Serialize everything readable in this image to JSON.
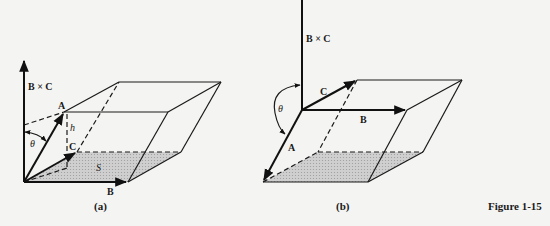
{
  "figure_label": "Figure 1-15",
  "panels": [
    {
      "id": "a",
      "caption": "(a)",
      "labels": {
        "axis": "B × C",
        "vec_a": "A",
        "vec_b": "B",
        "vec_c": "C",
        "height": "h",
        "area": "S",
        "angle": "θ"
      }
    },
    {
      "id": "b",
      "caption": "(b)",
      "labels": {
        "axis": "B × C",
        "vec_a": "A",
        "vec_b": "B",
        "vec_c": "C",
        "angle": "θ"
      }
    }
  ],
  "colors": {
    "line": "#1a1a1a",
    "shade": "#c8c8c8",
    "background": "#f4f4f2"
  }
}
